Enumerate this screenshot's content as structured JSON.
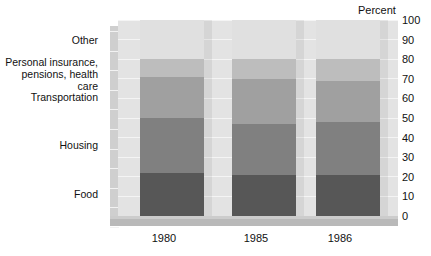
{
  "chart_data": {
    "type": "bar",
    "subtype": "stacked-percent-3d",
    "title": "",
    "axis_title": "Percent",
    "xlabel": "",
    "ylabel": "Percent",
    "categories": [
      "1980",
      "1985",
      "1986"
    ],
    "ylim": [
      0,
      100
    ],
    "yticks": [
      0,
      10,
      20,
      30,
      40,
      50,
      60,
      70,
      80,
      90,
      100
    ],
    "grid": true,
    "legend_position": "left-labels",
    "stack_order_bottom_to_top": [
      "Food",
      "Housing",
      "Transportation",
      "Personal insurance, pensions, health care",
      "Other"
    ],
    "series": [
      {
        "name": "Food",
        "color": "#575757",
        "values": [
          22,
          21,
          21
        ]
      },
      {
        "name": "Housing",
        "color": "#808080",
        "values": [
          28,
          26,
          27
        ]
      },
      {
        "name": "Transportation",
        "color": "#a0a0a0",
        "values": [
          21,
          23,
          21
        ]
      },
      {
        "name": "Personal insurance, pensions, health care",
        "color": "#bdbdbd",
        "values": [
          9,
          10,
          11
        ]
      },
      {
        "name": "Other",
        "color": "#e0e0e0",
        "values": [
          20,
          20,
          20
        ]
      }
    ]
  },
  "axis": {
    "percent_label": "Percent",
    "ytick_labels": [
      "100",
      "90",
      "80",
      "70",
      "60",
      "50",
      "40",
      "30",
      "20",
      "10",
      "0"
    ],
    "xtick_labels": [
      "1980",
      "1985",
      "1986"
    ]
  },
  "category_labels": {
    "other": "Other",
    "personal_insurance": "Personal insurance,\npensions, health care",
    "transportation": "Transportation",
    "housing": "Housing",
    "food": "Food"
  },
  "colors": {
    "other": "#e0e0e0",
    "personal_insurance": "#bdbdbd",
    "transportation": "#a0a0a0",
    "housing": "#808080",
    "food": "#575757",
    "back_wall": "#e3e3e3",
    "left_wall": "#cfcfcf",
    "right_wall": "#d5d5d5",
    "floor": "#b9b9b9"
  }
}
